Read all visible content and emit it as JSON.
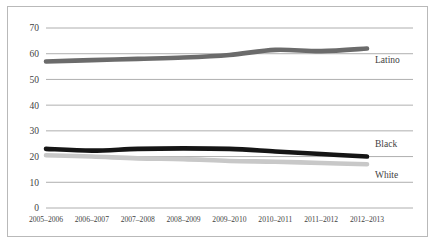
{
  "chart_data": {
    "type": "line",
    "title": "",
    "subtitle": "",
    "xlabel": "",
    "ylabel": "",
    "ylim": [
      0,
      70
    ],
    "yticks": [
      0,
      10,
      20,
      30,
      40,
      50,
      60,
      70
    ],
    "grid": true,
    "legend_position": "right-inline-labels",
    "categories": [
      "2005–2006",
      "2006–2007",
      "2007–2008",
      "2008–2009",
      "2009–2010",
      "2010–2011",
      "2011–2012",
      "2012–2013"
    ],
    "series": [
      {
        "name": "Latino",
        "color": "#6b6b6b",
        "values": [
          57,
          57.5,
          58,
          58.5,
          59.5,
          61.5,
          61,
          62
        ]
      },
      {
        "name": "Black",
        "color": "#151515",
        "values": [
          23,
          22.3,
          23,
          23.2,
          23,
          22,
          21,
          20
        ]
      },
      {
        "name": "White",
        "color": "#c8c8c8",
        "values": [
          20.5,
          20,
          19.3,
          19,
          18.3,
          18,
          17.5,
          17
        ]
      }
    ]
  },
  "axis": {
    "ytick_labels": [
      "0",
      "10",
      "20",
      "30",
      "40",
      "50",
      "60",
      "70"
    ]
  },
  "series_labels": {
    "latino": "Latino",
    "black": "Black",
    "white": "White"
  }
}
